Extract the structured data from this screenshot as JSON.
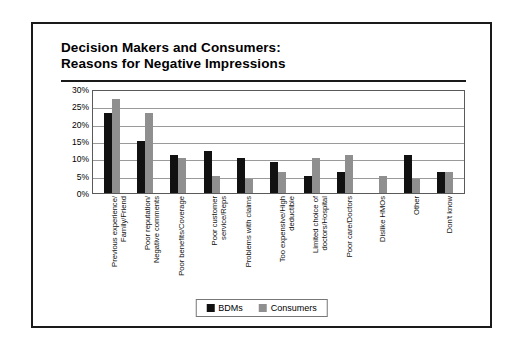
{
  "figure": {
    "title_line1": "Decision Makers and Consumers:",
    "title_line2": "Reasons for Negative Impressions"
  },
  "legend": {
    "position": "bottom-center",
    "entries": [
      {
        "label": "BDMs",
        "color": "#111111"
      },
      {
        "label": "Consumers",
        "color": "#8f8f8f"
      }
    ]
  },
  "chart_data": {
    "type": "bar",
    "title": "Decision Makers and Consumers: Reasons for Negative Impressions",
    "xlabel": "",
    "ylabel": "",
    "ylim": [
      0,
      30
    ],
    "ytick_labels": [
      "30%",
      "25%",
      "20%",
      "15%",
      "10%",
      "5%",
      "0%"
    ],
    "ytick_values": [
      30,
      25,
      20,
      15,
      10,
      5,
      0
    ],
    "grid": true,
    "categories": [
      "Previous experience/ Family/Friend",
      "Poor reputation/ Negative comments",
      "Poor benefits/Coverage",
      "Poor customer service/Reps",
      "Problems with claims",
      "Too expensive/High deductible",
      "Limited choice of doctors/Hospital",
      "Poor care/Doctors",
      "Dislike HMOs",
      "Other",
      "Don't know"
    ],
    "category_lines": [
      [
        "Previous experience/",
        "Family/Friend"
      ],
      [
        "Poor reputation/",
        "Negative comments"
      ],
      [
        "Poor benefits/Coverage",
        ""
      ],
      [
        "Poor customer",
        "service/Reps"
      ],
      [
        "Problems with claims",
        ""
      ],
      [
        "Too expensive/High",
        "deductible"
      ],
      [
        "Limited choice of",
        "doctors/Hospital"
      ],
      [
        "Poor care/Doctors",
        ""
      ],
      [
        "Dislike HMOs",
        ""
      ],
      [
        "Other",
        ""
      ],
      [
        "Don't know",
        ""
      ]
    ],
    "series": [
      {
        "name": "BDMs",
        "color": "#111111",
        "values": [
          23,
          15,
          11,
          12,
          10,
          9,
          5,
          6,
          0,
          11,
          6
        ]
      },
      {
        "name": "Consumers",
        "color": "#8f8f8f",
        "values": [
          27,
          23,
          10,
          5,
          4,
          6,
          10,
          11,
          5,
          4,
          6
        ]
      }
    ]
  }
}
